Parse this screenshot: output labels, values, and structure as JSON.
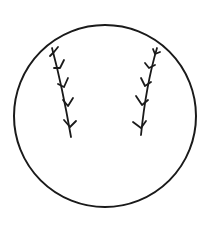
{
  "icon": {
    "name": "baseball-icon",
    "stroke_color": "#1a1a1a",
    "background": "#ffffff",
    "ball": {
      "cx": 105,
      "cy": 116,
      "r": 91
    },
    "stitches": {
      "left": {
        "spine": [
          [
            52,
            48
          ],
          [
            57,
            64
          ],
          [
            63,
            82
          ],
          [
            67,
            100
          ],
          [
            70,
            118
          ],
          [
            71,
            137
          ]
        ],
        "chevrons": 5
      },
      "right": {
        "spine": [
          [
            157,
            48
          ],
          [
            152,
            64
          ],
          [
            147,
            82
          ],
          [
            143,
            100
          ],
          [
            141,
            118
          ],
          [
            141,
            135
          ]
        ],
        "chevrons": 5
      }
    }
  }
}
